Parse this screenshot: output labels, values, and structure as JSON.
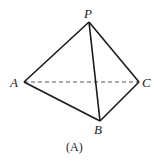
{
  "figure": {
    "caption": "(A)",
    "points": {
      "P": {
        "label": "P",
        "x": 89,
        "y": 22
      },
      "A": {
        "label": "A",
        "x": 24,
        "y": 82
      },
      "B": {
        "label": "B",
        "x": 100,
        "y": 121
      },
      "C": {
        "label": "C",
        "x": 139,
        "y": 82
      }
    },
    "solid_edges": [
      "PA",
      "PB",
      "PC",
      "AB",
      "BC"
    ],
    "dashed_edges": [
      "AC"
    ],
    "colors": {
      "stroke": "#1a1a1a",
      "dashed": "#555555",
      "background": "#ffffff"
    }
  }
}
